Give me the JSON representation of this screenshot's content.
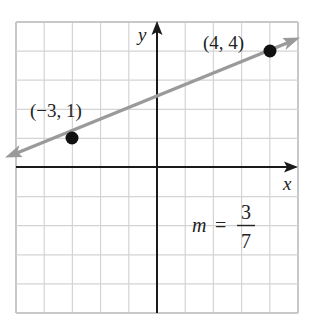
{
  "diagram": {
    "type": "coordinate-plane-line",
    "grid": {
      "x_min": -5,
      "x_max": 5,
      "y_min": -5,
      "y_max": 5,
      "step": 1,
      "color": "#d4d4d4",
      "border_color": "#c8c8c8"
    },
    "axes": {
      "x_label": "x",
      "y_label": "y",
      "color": "#1a1a1a"
    },
    "line": {
      "color": "#9a9a9a",
      "passes_through": [
        [
          -3,
          1
        ],
        [
          4,
          4
        ]
      ],
      "arrows": "both"
    },
    "points": [
      {
        "x": -3,
        "y": 1,
        "label": "(−3, 1)"
      },
      {
        "x": 4,
        "y": 4,
        "label": "(4, 4)"
      }
    ],
    "point_color": "#111111",
    "slope": {
      "symbol": "m",
      "equals": "=",
      "numerator": "3",
      "denominator": "7"
    }
  },
  "chart_data": {
    "type": "line",
    "title": "",
    "xlabel": "x",
    "ylabel": "y",
    "xlim": [
      -5,
      5
    ],
    "ylim": [
      -5,
      5
    ],
    "grid": true,
    "series": [
      {
        "name": "line through (-3,1) and (4,4)",
        "x": [
          -3,
          4
        ],
        "y": [
          1,
          4
        ]
      }
    ],
    "annotations": [
      "(−3, 1)",
      "(4, 4)",
      "m = 3/7"
    ],
    "slope": "3/7"
  }
}
